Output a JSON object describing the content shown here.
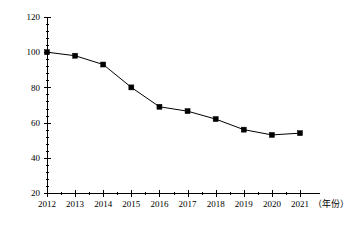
{
  "chart_data": {
    "type": "line",
    "title": "",
    "xlabel": "（年份）",
    "ylabel": "",
    "categories": [
      "2012",
      "2013",
      "2014",
      "2015",
      "2016",
      "2017",
      "2018",
      "2019",
      "2020",
      "2021"
    ],
    "x": [
      2012,
      2013,
      2014,
      2015,
      2016,
      2017,
      2018,
      2019,
      2020,
      2021
    ],
    "values": [
      100,
      98,
      93,
      80,
      69,
      66.5,
      62,
      56,
      53,
      54
    ],
    "series": [
      {
        "name": "",
        "values": [
          100,
          98,
          93,
          80,
          69,
          66.5,
          62,
          56,
          53,
          54
        ]
      }
    ],
    "ylim": [
      20,
      120
    ],
    "xlim": [
      2011.5,
      2021.5
    ],
    "y_ticks": [
      20,
      40,
      60,
      80,
      100,
      120
    ],
    "y_tick_labels": [
      "20",
      "40",
      "60",
      "80",
      "100",
      "120"
    ],
    "y_minor_count_per_interval": 4,
    "x_ticks": [
      2012,
      2013,
      2014,
      2015,
      2016,
      2017,
      2018,
      2019,
      2020,
      2021
    ],
    "grid": false,
    "legend": false,
    "legend_position": "none",
    "marker": "square",
    "line_color": "#000000",
    "marker_color": "#000000",
    "background_color": "#ffffff"
  }
}
